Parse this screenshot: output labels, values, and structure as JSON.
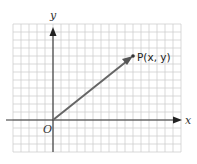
{
  "diagram": {
    "type": "vector-coordinate-diagram",
    "axes": {
      "x_label": "x",
      "y_label": "y",
      "origin_label": "O"
    },
    "point": {
      "label": "P(x, y)"
    },
    "colors": {
      "grid": "#c8c8c8",
      "axis": "#333333",
      "vector": "#555555"
    }
  },
  "chart_data": {
    "type": "scatter",
    "title": "",
    "xlabel": "x",
    "ylabel": "y",
    "x": [
      0,
      10
    ],
    "y": [
      0,
      8
    ],
    "annotations": [
      "O",
      "P(x, y)"
    ],
    "grid": true
  }
}
